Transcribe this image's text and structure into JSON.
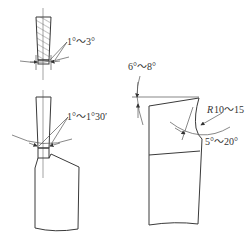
{
  "diagram": {
    "left_tool_top": {
      "angle_label": "1°～3°"
    },
    "left_tool_bottom": {
      "angle_label": "1°～1°30′"
    },
    "right_tool": {
      "top_angle_label": "6°～8°",
      "radius_prefix": "R",
      "radius_label": "10～15",
      "side_angle_label": "5°～20°"
    }
  },
  "colors": {
    "line": "#3a3a3a",
    "background": "#ffffff"
  }
}
